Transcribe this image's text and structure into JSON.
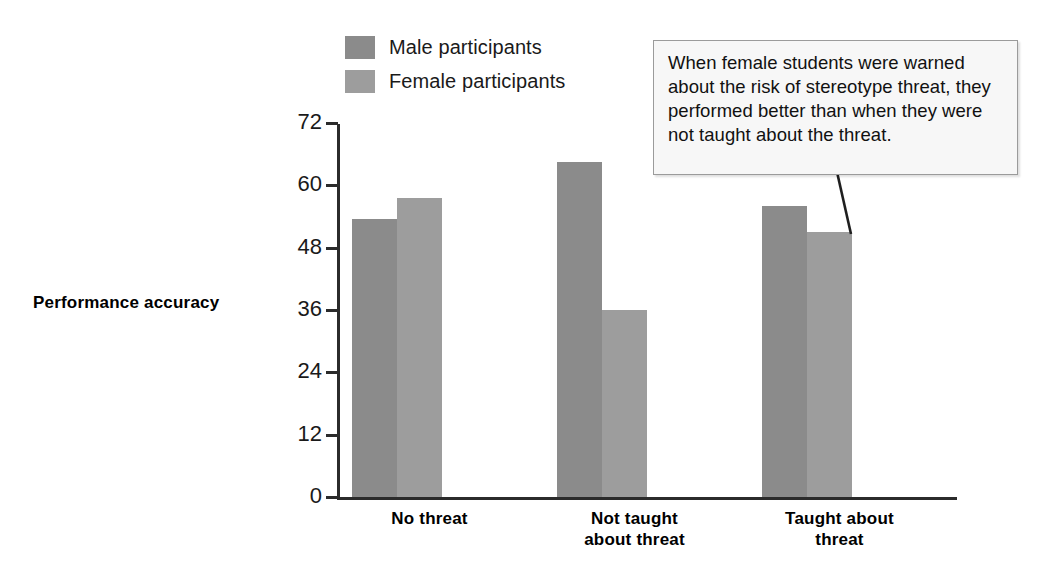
{
  "chart_data": {
    "type": "bar",
    "title": "",
    "xlabel": "",
    "ylabel": "Performance accuracy",
    "ylim": [
      0,
      72
    ],
    "yticks": [
      0,
      12,
      24,
      36,
      48,
      60,
      72
    ],
    "ytick_labels": [
      "0",
      "12",
      "24",
      "36",
      "48",
      "60",
      "72"
    ],
    "grid": false,
    "legend_position": "top-center",
    "categories": [
      "No threat",
      "Not taught about threat",
      "Taught about threat"
    ],
    "category_label_lines": [
      [
        "No threat"
      ],
      [
        "Not taught",
        "about threat"
      ],
      [
        "Taught about",
        "threat"
      ]
    ],
    "series": [
      {
        "name": "Male participants",
        "color": "#8b8b8b",
        "values": [
          53.5,
          64.5,
          56
        ]
      },
      {
        "name": "Female participants",
        "color": "#9d9d9d",
        "values": [
          57.5,
          36,
          51
        ]
      }
    ],
    "annotations": [
      {
        "name": "stereotype-threat-callout",
        "text": "When female students were warned about the risk of stereotype threat, they performed better than when they were not taught about the threat.",
        "points_to": "Taught about threat / Female participants bar"
      }
    ]
  },
  "legend": {
    "items": [
      {
        "label": "Male participants",
        "color": "#8b8b8b"
      },
      {
        "label": "Female participants",
        "color": "#9d9d9d"
      }
    ]
  },
  "axes": {
    "y_title": "Performance accuracy",
    "y_ticks": [
      "72",
      "60",
      "48",
      "36",
      "24",
      "12",
      "0"
    ]
  },
  "callout": {
    "text": "When female students were warned about the risk of stereotype threat, they performed better than when they were not taught about the threat."
  }
}
